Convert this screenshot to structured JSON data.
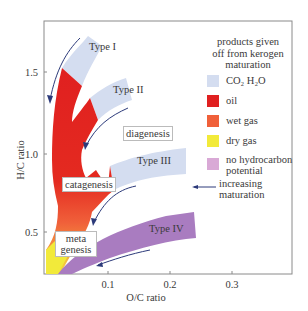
{
  "diagram": {
    "type": "van Krevelen diagram",
    "x_axis": {
      "label": "O/C ratio",
      "ticks": [
        "0.1",
        "0.2",
        "0.3"
      ]
    },
    "y_axis": {
      "label": "H/C ratio",
      "ticks": [
        "0.5",
        "1.0",
        "1.5"
      ]
    },
    "kerogen_types": [
      "Type I",
      "Type II",
      "Type III",
      "Type IV"
    ],
    "stage_labels": {
      "diagenesis": "diagenesis",
      "catagenesis": "catagenesis",
      "metagenesis_1": "meta",
      "metagenesis_2": "genesis"
    },
    "legend": {
      "title": [
        "products given",
        "off from kerogen",
        "maturation"
      ],
      "items": [
        {
          "label": "CO₂ H₂O",
          "color": "#d4ddf0"
        },
        {
          "label": "oil",
          "color": "#e02020"
        },
        {
          "label": "wet gas",
          "color": "#f0603a"
        },
        {
          "label": "dry gas",
          "color": "#f2ea3a"
        },
        {
          "label": "no hydrocarbon potential",
          "label_1": "no hydrocarbon",
          "label_2": "potential",
          "color": "#d9a9d6"
        }
      ],
      "arrow_label_1": "increasing",
      "arrow_label_2": "maturation"
    },
    "colors": {
      "co2_h2o": "#d4ddf0",
      "oil": "#e02020",
      "wet_gas": "#f0603a",
      "dry_gas": "#f2ea3a",
      "type_iv_band": "#a97cc0",
      "arrow": "#2c3a7a",
      "frame": "#888888"
    }
  }
}
